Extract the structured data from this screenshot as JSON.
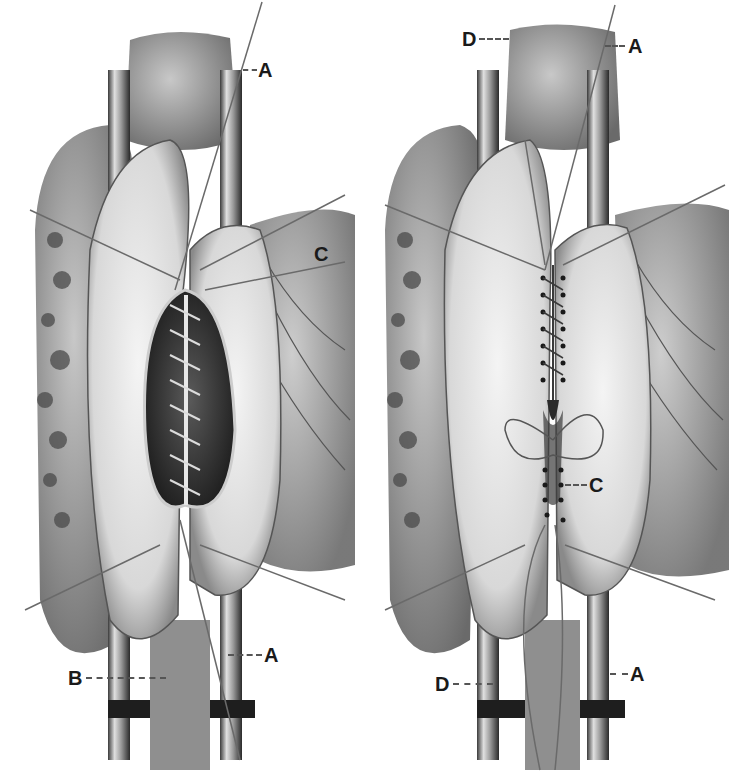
{
  "figure": {
    "panels": [
      {
        "id": "left",
        "description": "Opened intestinal segment with continuous suture of posterior wall",
        "labels": {
          "A_top": "A",
          "C": "C",
          "A_bottom": "A",
          "B": "B"
        }
      },
      {
        "id": "right",
        "description": "Closed anterior wall with interrupted sutures",
        "labels": {
          "D_top": "D",
          "A_top": "A",
          "C": "C",
          "D_bottom": "D",
          "A_bottom": "A"
        }
      }
    ],
    "colors": {
      "background": "#ffffff",
      "ink": "#1a1a1a",
      "tissue_light": "#e8e8e8",
      "tissue_mid": "#b5b5b5",
      "tissue_dark": "#3a3a3a"
    }
  }
}
